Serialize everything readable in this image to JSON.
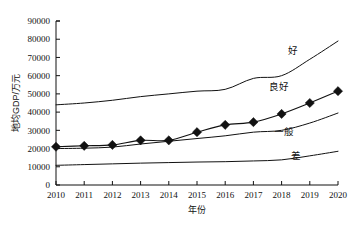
{
  "chart_data": {
    "type": "line",
    "title": "",
    "xlabel": "年份",
    "ylabel": "地均GDP/万元",
    "x": [
      2010,
      2011,
      2012,
      2013,
      2014,
      2015,
      2016,
      2017,
      2018,
      2019,
      2020
    ],
    "xtick_labels": [
      "2010",
      "2011",
      "2012",
      "2013",
      "2014",
      "2015",
      "2016",
      "2017",
      "2018",
      "2019",
      "2020"
    ],
    "ytick_labels": [
      "0",
      "10000",
      "20000",
      "30000",
      "40000",
      "50000",
      "60000",
      "70000",
      "80000",
      "90000"
    ],
    "ytick_values": [
      0,
      10000,
      20000,
      30000,
      40000,
      50000,
      60000,
      70000,
      80000,
      90000
    ],
    "xlim": [
      2010,
      2020
    ],
    "ylim": [
      0,
      90000
    ],
    "grid": false,
    "legend_position": "inline-right",
    "series": [
      {
        "name": "好",
        "label": "好",
        "marker": "none",
        "values": [
          44000,
          45000,
          46500,
          48500,
          50000,
          51500,
          52500,
          58500,
          60000,
          69000,
          79000
        ]
      },
      {
        "name": "良好",
        "label": "良好",
        "marker": "diamond",
        "values": [
          21000,
          21500,
          22000,
          24500,
          24500,
          29000,
          33000,
          34500,
          39000,
          45000,
          51500
        ]
      },
      {
        "name": "一般",
        "label": "一般",
        "marker": "none",
        "values": [
          20000,
          20200,
          20800,
          22500,
          24000,
          25500,
          27000,
          29000,
          30000,
          34000,
          39500
        ]
      },
      {
        "name": "差",
        "label": "差",
        "marker": "none",
        "values": [
          10800,
          11200,
          11600,
          12000,
          12300,
          12600,
          12800,
          13200,
          13800,
          16000,
          18500
        ]
      }
    ],
    "annotations": [
      {
        "text": "好",
        "x": 2018.4,
        "y": 72000
      },
      {
        "text": "良好",
        "x": 2017.9,
        "y": 52000
      },
      {
        "text": "一般",
        "x": 2018.1,
        "y": 27500
      },
      {
        "text": "差",
        "x": 2018.5,
        "y": 14500
      }
    ]
  }
}
